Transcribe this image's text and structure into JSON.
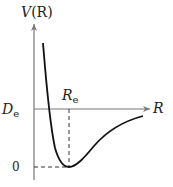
{
  "diagram": {
    "y_axis_label": "V(R)",
    "y_axis_label_main": "V",
    "y_axis_label_arg": "(R)",
    "x_axis_label": "R",
    "equilibrium_label_main": "R",
    "equilibrium_label_sub": "e",
    "dissociation_label_main": "D",
    "dissociation_label_sub": "e",
    "zero_label": "0",
    "colors": {
      "axis": "#777777",
      "curve": "#111111",
      "dashed": "#333333",
      "text": "#222222"
    }
  }
}
